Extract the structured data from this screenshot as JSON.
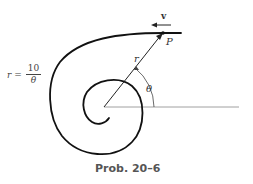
{
  "figure": {
    "caption": "Prob. 20–6",
    "equation": {
      "lhs": "r =",
      "numerator": "10",
      "denominator": "θ"
    },
    "labels": {
      "velocity": "v",
      "point": "P",
      "radius": "r",
      "angle": "θ"
    },
    "colors": {
      "curve": "#111111",
      "reference_line": "#888888",
      "caption": "#555555"
    }
  }
}
